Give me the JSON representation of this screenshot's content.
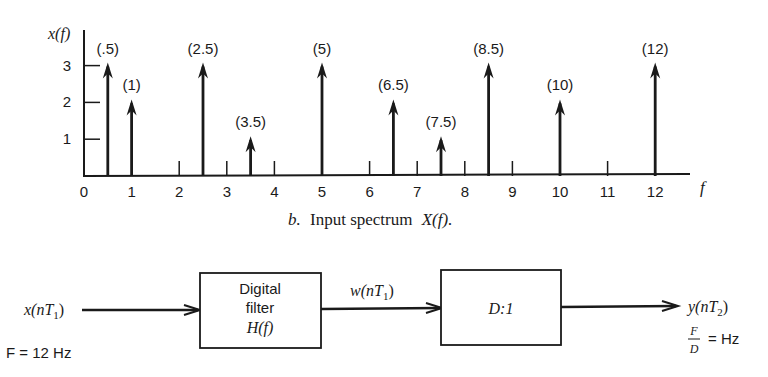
{
  "chart_data": {
    "type": "stem",
    "title": "",
    "ylabel": "x(f)",
    "xlabel": "f",
    "xlim": [
      0,
      12.5
    ],
    "ylim": [
      0,
      3.5
    ],
    "x_ticks": [
      0,
      1,
      2,
      3,
      4,
      5,
      6,
      7,
      8,
      9,
      10,
      11,
      12
    ],
    "y_ticks": [
      1,
      2,
      3
    ],
    "grid": false,
    "points": [
      {
        "x": 0.5,
        "y": 3,
        "label": "(.5)"
      },
      {
        "x": 1,
        "y": 2,
        "label": "(1)"
      },
      {
        "x": 2.5,
        "y": 3,
        "label": "(2.5)"
      },
      {
        "x": 3.5,
        "y": 1,
        "label": "(3.5)"
      },
      {
        "x": 5,
        "y": 3,
        "label": "(5)"
      },
      {
        "x": 6.5,
        "y": 2,
        "label": "(6.5)"
      },
      {
        "x": 7.5,
        "y": 1,
        "label": "(7.5)"
      },
      {
        "x": 8.5,
        "y": 3,
        "label": "(8.5)"
      },
      {
        "x": 10,
        "y": 2,
        "label": "(10)"
      },
      {
        "x": 12,
        "y": 3,
        "label": "(12)"
      }
    ],
    "caption": {
      "prefix": "b.",
      "text": "Input spectrum",
      "math": "X(f)."
    }
  },
  "block_diagram": {
    "input_signal": "x(nT",
    "input_sub": "1",
    "input_rate": "F = 12 Hz",
    "filter_block": {
      "line1": "Digital",
      "line2": "filter",
      "line3": "H(f)"
    },
    "mid_signal": "w(nT",
    "mid_sub": "1",
    "decimator_block": "D:1",
    "output_signal": "y(nT",
    "output_sub": "2",
    "output_rate_num": "F",
    "output_rate_den": "D",
    "output_rate_unit": "= Hz"
  }
}
